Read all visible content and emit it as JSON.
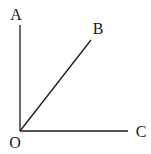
{
  "diagram": {
    "type": "angle-rays",
    "vertex": {
      "label": "O",
      "x": 20,
      "y": 131
    },
    "rays": [
      {
        "label": "A",
        "end": {
          "x": 20,
          "y": 25
        },
        "label_pos": {
          "x": 16,
          "y": 20
        }
      },
      {
        "label": "B",
        "end": {
          "x": 91,
          "y": 40
        },
        "label_pos": {
          "x": 98,
          "y": 34
        }
      },
      {
        "label": "C",
        "end": {
          "x": 128,
          "y": 131
        },
        "label_pos": {
          "x": 141,
          "y": 137
        }
      }
    ],
    "vertex_label_pos": {
      "x": 15,
      "y": 148
    },
    "line_color": "#1a1a1a"
  }
}
